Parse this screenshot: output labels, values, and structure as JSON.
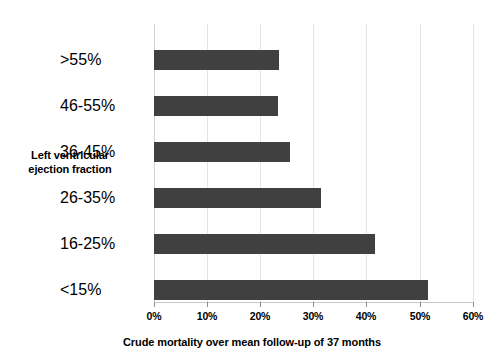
{
  "chart_data": {
    "type": "bar",
    "orientation": "horizontal",
    "title": "",
    "xlabel": "Crude mortality over mean follow-up of 37 months",
    "ylabel": "Left ventricular ejection fraction",
    "ylabel_lines": [
      "Left ventricular",
      "ejection fraction"
    ],
    "categories": [
      ">55%",
      "46-55%",
      "36-45%",
      "26-35%",
      "16-25%",
      "<15%"
    ],
    "values": [
      23.5,
      23.3,
      25.5,
      31.5,
      41.5,
      51.5
    ],
    "xlim": [
      0,
      60
    ],
    "xticks": [
      0,
      10,
      20,
      30,
      40,
      50,
      60
    ],
    "xtick_labels": [
      "0%",
      "10%",
      "20%",
      "30%",
      "40%",
      "50%",
      "60%"
    ],
    "grid": true,
    "grid_axis": "x",
    "legend": null,
    "bar_color": "#404040",
    "grid_color": "#e4e4e4",
    "axis_color": "#c8c8c8",
    "background_color": "#ffffff"
  }
}
